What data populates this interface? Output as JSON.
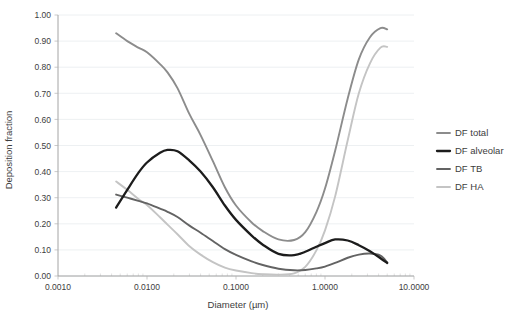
{
  "chart_data": {
    "type": "line",
    "title": "",
    "xlabel": "Diameter (µm)",
    "ylabel": "Deposition fraction",
    "xscale": "log",
    "xlim": [
      0.001,
      10.0
    ],
    "ylim": [
      0.0,
      1.0
    ],
    "grid": "horizontal",
    "legend_position": "right",
    "xticks": [
      0.001,
      0.01,
      0.1,
      1.0,
      10.0
    ],
    "xtick_labels": [
      "0.0010",
      "0.0100",
      "0.1000",
      "1.0000",
      "10.0000"
    ],
    "yticks": [
      0.0,
      0.1,
      0.2,
      0.3,
      0.4,
      0.5,
      0.6,
      0.7,
      0.8,
      0.9,
      1.0
    ],
    "ytick_labels": [
      "0.00",
      "0.10",
      "0.20",
      "0.30",
      "0.40",
      "0.50",
      "0.60",
      "0.70",
      "0.80",
      "0.90",
      "1.00"
    ],
    "x": [
      0.0045,
      0.006,
      0.008,
      0.01,
      0.014,
      0.017,
      0.022,
      0.03,
      0.04,
      0.055,
      0.075,
      0.1,
      0.15,
      0.2,
      0.3,
      0.45,
      0.6,
      0.8,
      1.0,
      1.3,
      1.8,
      2.4,
      3.2,
      4.2,
      5.0
    ],
    "series": [
      {
        "name": "DF total",
        "color": "#8c8c8c",
        "width": 1.9,
        "values": [
          0.93,
          0.9,
          0.875,
          0.857,
          0.812,
          0.78,
          0.72,
          0.62,
          0.54,
          0.44,
          0.34,
          0.27,
          0.205,
          0.172,
          0.14,
          0.138,
          0.168,
          0.245,
          0.335,
          0.48,
          0.68,
          0.83,
          0.915,
          0.95,
          0.945
        ]
      },
      {
        "name": "DF alveolar",
        "color": "#1c1c1c",
        "width": 2.3,
        "values": [
          0.262,
          0.33,
          0.395,
          0.435,
          0.472,
          0.483,
          0.478,
          0.442,
          0.4,
          0.34,
          0.27,
          0.215,
          0.155,
          0.12,
          0.085,
          0.08,
          0.093,
          0.112,
          0.126,
          0.14,
          0.136,
          0.118,
          0.095,
          0.068,
          0.05
        ]
      },
      {
        "name": "DF TB",
        "color": "#636363",
        "width": 1.9,
        "values": [
          0.312,
          0.3,
          0.288,
          0.278,
          0.258,
          0.246,
          0.226,
          0.193,
          0.166,
          0.134,
          0.103,
          0.081,
          0.056,
          0.042,
          0.028,
          0.022,
          0.023,
          0.029,
          0.036,
          0.05,
          0.07,
          0.082,
          0.086,
          0.078,
          0.052
        ]
      },
      {
        "name": "DF HA",
        "color": "#c4c4c4",
        "width": 1.9,
        "values": [
          0.362,
          0.33,
          0.295,
          0.272,
          0.225,
          0.197,
          0.16,
          0.114,
          0.082,
          0.053,
          0.032,
          0.021,
          0.011,
          0.007,
          0.005,
          0.01,
          0.035,
          0.098,
          0.175,
          0.305,
          0.52,
          0.7,
          0.815,
          0.875,
          0.878
        ]
      }
    ]
  },
  "legend": {
    "items": [
      {
        "label": "DF total",
        "color": "#8c8c8c"
      },
      {
        "label": "DF alveolar",
        "color": "#1c1c1c"
      },
      {
        "label": "DF TB",
        "color": "#636363"
      },
      {
        "label": "DF HA",
        "color": "#c4c4c4"
      }
    ]
  }
}
